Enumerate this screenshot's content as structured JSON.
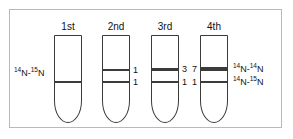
{
  "figure": {
    "background_color": "#ffffff",
    "frame_color": "#b9b9b9",
    "tube_color": "#3b3b3b",
    "text_color": "#111111"
  },
  "left_annotation": {
    "prefix_sup": "14",
    "prefix": "N-",
    "suffix_sup": "15",
    "suffix": "N"
  },
  "right_annotations": [
    {
      "name": "heavy-light-upper",
      "prefix_sup": "14",
      "prefix": "N-",
      "suffix_sup": "14",
      "suffix": "N"
    },
    {
      "name": "hybrid-lower",
      "prefix_sup": "14",
      "prefix": "N-",
      "suffix_sup": "15",
      "suffix": "N"
    }
  ],
  "tubes": [
    {
      "header": "1st",
      "bands": [
        {
          "label": "",
          "label_side": "none",
          "thickness": 1.6,
          "position": 45
        }
      ]
    },
    {
      "header": "2nd",
      "bands": [
        {
          "label": "1",
          "label_side": "right",
          "thickness": 1.6,
          "position": 33
        },
        {
          "label": "1",
          "label_side": "right",
          "thickness": 1.6,
          "position": 45
        }
      ]
    },
    {
      "header": "3rd",
      "bands": [
        {
          "label": "3",
          "label_side": "right",
          "thickness": 3.0,
          "position": 33
        },
        {
          "label": "1",
          "label_side": "right",
          "thickness": 1.6,
          "position": 45
        }
      ]
    },
    {
      "header": "4th",
      "bands": [
        {
          "label": "7",
          "label_side": "left",
          "thickness": 4.2,
          "position": 33
        },
        {
          "label": "1",
          "label_side": "left",
          "thickness": 1.6,
          "position": 45
        }
      ]
    }
  ]
}
